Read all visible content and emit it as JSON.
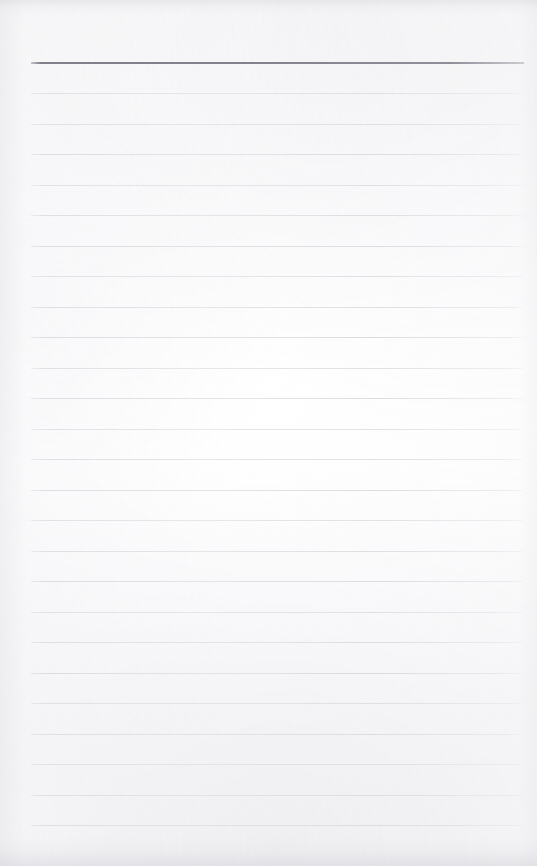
{
  "document": {
    "kind": "scanned-lined-notepad-page",
    "title": "Blank Lined Notepad Page",
    "has_text": false,
    "text_content": "",
    "page_width": 537,
    "page_height": 866
  },
  "colors": {
    "paper": "#fcfcfd",
    "header_rule": "#808089",
    "body_rule": "#dcdcdf",
    "edge_shadow": "#c6c6ce"
  },
  "ruling": {
    "line_start_x": 31,
    "line_end_x": 524,
    "line_spacing": 30.5,
    "header_rule_y": 62,
    "header_rule_thickness": 2,
    "body_rule_thickness": 1,
    "first_body_rule_y": 93,
    "body_rule_count": 25,
    "body_rule_y": [
      93,
      123.5,
      154,
      184.5,
      215,
      245.5,
      276,
      306.5,
      337,
      367.5,
      398,
      428.5,
      459,
      489.5,
      520,
      550.5,
      581,
      611.5,
      642,
      672.5,
      703,
      733.5,
      764,
      794.5,
      825
    ]
  }
}
